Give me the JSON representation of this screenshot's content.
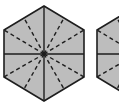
{
  "figure": {
    "colors": {
      "fill": "#bdbdbd",
      "stroke": "#1e1e1e",
      "background": "#ffffff"
    },
    "hexagons": [
      {
        "id": "hexagon-1",
        "center": [
          44,
          54
        ],
        "vertices": [
          [
            44,
            6
          ],
          [
            84,
            30
          ],
          [
            84,
            77
          ],
          [
            44,
            101
          ],
          [
            4,
            77
          ],
          [
            4,
            30
          ]
        ],
        "solid_lines": [
          [
            [
              44,
              6
            ],
            [
              44,
              101
            ]
          ],
          [
            [
              4,
              54
            ],
            [
              84,
              54
            ]
          ]
        ],
        "dashed_targets": [
          [
            84,
            30
          ],
          [
            84,
            77
          ],
          [
            4,
            77
          ],
          [
            4,
            30
          ],
          [
            64,
            18
          ],
          [
            64,
            89
          ],
          [
            24,
            89
          ],
          [
            24,
            18
          ]
        ]
      },
      {
        "id": "hexagon-2",
        "center": [
          137,
          54
        ],
        "vertices": [
          [
            137,
            6
          ],
          [
            177,
            30
          ],
          [
            177,
            77
          ],
          [
            137,
            101
          ],
          [
            97,
            77
          ],
          [
            97,
            30
          ]
        ],
        "solid_lines": [
          [
            [
              137,
              6
            ],
            [
              137,
              101
            ]
          ],
          [
            [
              97,
              54
            ],
            [
              177,
              54
            ]
          ]
        ],
        "dashed_targets": [
          [
            97,
            77
          ],
          [
            97,
            30
          ],
          [
            117,
            89
          ],
          [
            117,
            18
          ]
        ]
      }
    ]
  }
}
